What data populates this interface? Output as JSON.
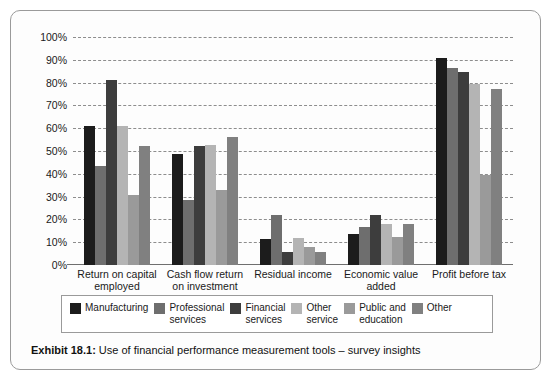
{
  "exhibit": {
    "caption_label": "Exhibit 18.1:",
    "caption_text": "Use of financial performance measurement tools  –  survey insights"
  },
  "chart_data": {
    "type": "bar",
    "title": "",
    "xlabel": "",
    "ylabel": "",
    "ylim": [
      0,
      100
    ],
    "yticks": [
      "0%",
      "10%",
      "20%",
      "30%",
      "40%",
      "50%",
      "60%",
      "70%",
      "80%",
      "90%",
      "100%"
    ],
    "ytick_values": [
      0,
      10,
      20,
      30,
      40,
      50,
      60,
      70,
      80,
      90,
      100
    ],
    "grid": true,
    "legend_position": "bottom",
    "categories": [
      "Return on capital\nemployed",
      "Cash flow return\non investment",
      "Residual income",
      "Economic value\nadded",
      "Profit before tax"
    ],
    "series": [
      {
        "name": "Manufacturing",
        "color": "#1c1c1c",
        "values": [
          61.0,
          48.5,
          11.5,
          13.5,
          91.0
        ]
      },
      {
        "name": "Professional\nservices",
        "color": "#6e6e6e",
        "values": [
          43.5,
          28.5,
          22.0,
          16.5,
          86.5
        ]
      },
      {
        "name": "Financial\nservices",
        "color": "#3d3d3d",
        "values": [
          81.0,
          52.0,
          5.5,
          22.0,
          84.5
        ]
      },
      {
        "name": "Other\nservice",
        "color": "#b4b4b4",
        "values": [
          61.0,
          52.5,
          12.0,
          18.0,
          79.5
        ]
      },
      {
        "name": "Public and\neducation",
        "color": "#9a9a9a",
        "values": [
          30.5,
          33.0,
          8.0,
          12.5,
          39.5
        ]
      },
      {
        "name": "Other",
        "color": "#808080",
        "values": [
          52.0,
          56.0,
          5.5,
          18.0,
          77.0
        ]
      }
    ]
  }
}
